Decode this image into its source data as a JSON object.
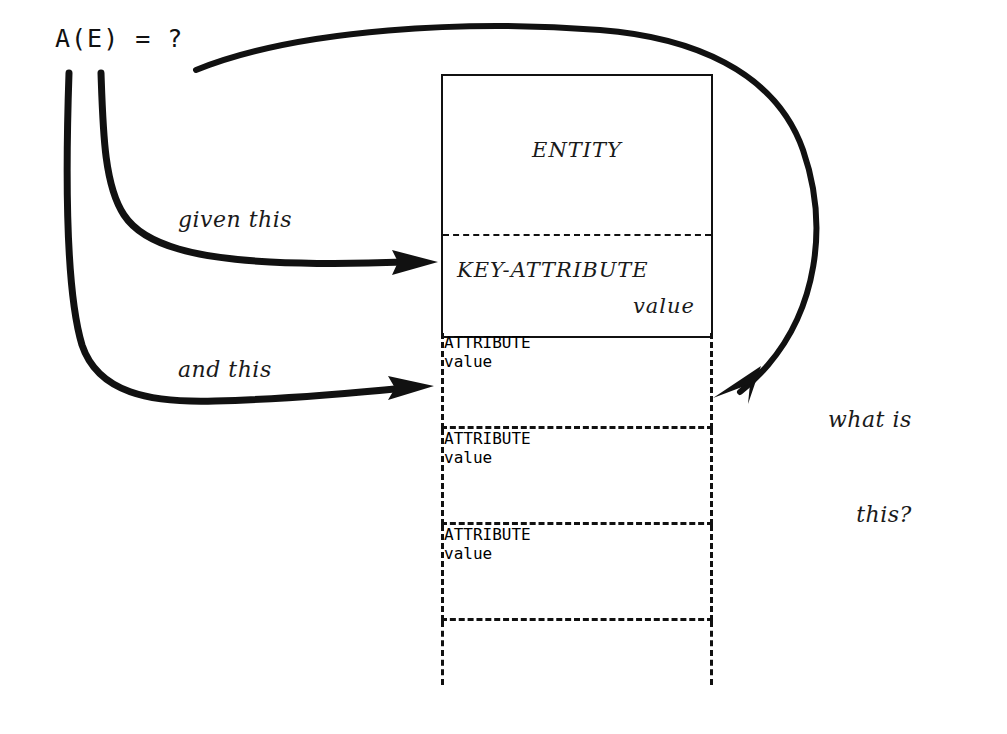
{
  "diagram": {
    "formula": "A(E) = ?",
    "annotations": {
      "given": "given this",
      "and": "and this",
      "what_line1": "what is",
      "what_line2": "this?"
    },
    "record": {
      "entity_label": "ENTITY",
      "key_row": {
        "name": "KEY-ATTRIBUTE",
        "value": "value"
      },
      "attribute_rows": [
        {
          "name": "ATTRIBUTE",
          "value": "value"
        },
        {
          "name": "ATTRIBUTE",
          "value": "value"
        },
        {
          "name": "ATTRIBUTE",
          "value": "value"
        }
      ]
    },
    "colors": {
      "ink": "#111111",
      "paper": "#ffffff"
    }
  }
}
